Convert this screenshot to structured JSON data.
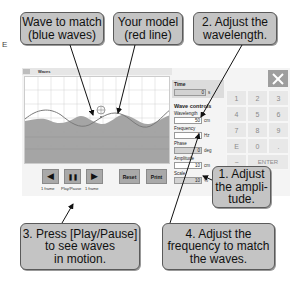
{
  "side_marker": "E",
  "callouts": {
    "wave_to_match": "Wave to match\n(blue waves)",
    "your_model": "Your model\n(red line)",
    "adjust_wavelength": "2. Adjust the\nwavelength.",
    "adjust_amplitude": "1. Adjust\nthe ampli-\ntude.",
    "press_play": "3. Press [Play/Pause]\nto see waves\nin motion.",
    "adjust_frequency": "4. Adjust the\nfrequency to match\nthe waves."
  },
  "window": {
    "title": "Waves"
  },
  "controls": {
    "step_back": {
      "icon": "step-back-icon",
      "glyph": "◀",
      "label": "1 frame"
    },
    "play_pause": {
      "icon": "pause-icon",
      "glyph": "❚❚",
      "label": "Play/Pause"
    },
    "step_forward": {
      "icon": "step-forward-icon",
      "glyph": "▶",
      "label": "1 frame"
    },
    "reset_label": "Reset",
    "print_label": "Print"
  },
  "panel": {
    "time_label": "Time",
    "time_value": "0",
    "time_unit": "s",
    "section_title": "Wave controls",
    "wavelength_label": "Wavelength",
    "wavelength_value": "50",
    "wavelength_unit": "cm",
    "frequency_label": "Frequency",
    "frequency_value": "1",
    "frequency_unit": "Hz",
    "phase_label": "Phase",
    "phase_value": "0",
    "phase_unit": "deg",
    "amplitude_label": "Amplitude",
    "amplitude_value": "10",
    "amplitude_unit": "cm",
    "scale_label": "Scale",
    "scale_value": "10",
    "scale_unit": "%"
  },
  "numpad": {
    "close_icon": "close-icon",
    "keys": [
      "1",
      "2",
      "3",
      "4",
      "5",
      "6",
      "7",
      "8",
      "9",
      "E",
      "0",
      ".",
      "−"
    ],
    "enter_label": "ENTER"
  },
  "colors": {
    "callout_bg": "#c4c4c4",
    "button_bg": "#a9a9a9",
    "wave_fill": "#a0a0a0",
    "model_line": "#7a7a7a"
  }
}
